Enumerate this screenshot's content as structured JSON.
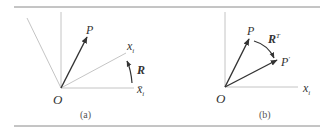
{
  "figure": {
    "panels": [
      {
        "id": "a",
        "caption": "(a)",
        "labels": {
          "origin": "O",
          "vector": "P",
          "rotated_axis": "x",
          "rotated_axis_sub": "i",
          "rotation": "R",
          "fixed_axis": "x̄",
          "fixed_axis_sub": "i"
        }
      },
      {
        "id": "b",
        "caption": "(b)",
        "labels": {
          "origin": "O",
          "vector": "P",
          "rotation": "R",
          "rotation_sup": "T",
          "rotated_vector": "P",
          "rotated_vector_sup": "′",
          "axis": "x",
          "axis_sub": "i"
        }
      }
    ],
    "colors": {
      "rule": "#8a8a8a",
      "axis": "#b5b5b5",
      "vector": "#333333",
      "text": "#333333"
    }
  }
}
